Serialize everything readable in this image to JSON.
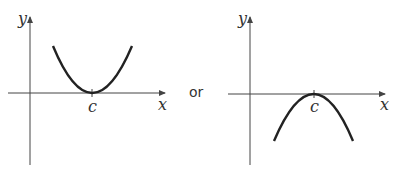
{
  "figure": {
    "connector": "or",
    "left_graph": {
      "description": "upward-opening parabola with minimum touching x-axis at c",
      "y_label": "y",
      "x_label": "x",
      "point_label": "c"
    },
    "right_graph": {
      "description": "downward-opening parabola with maximum touching x-axis at c",
      "y_label": "y",
      "x_label": "x",
      "point_label": "c"
    },
    "colors": {
      "axis": "#444444",
      "curve": "#222222",
      "text": "#333333"
    }
  }
}
